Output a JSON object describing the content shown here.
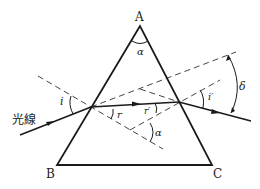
{
  "diagram": {
    "vertices": {
      "A": "A",
      "B": "B",
      "C": "C"
    },
    "labels": {
      "ray": "光線",
      "apex_angle": "α",
      "incidence_angle": "i",
      "refraction_angle": "r",
      "internal_incidence_angle": "r′",
      "exit_angle": "i′",
      "deviation_angle": "δ",
      "normals_angle": "α"
    },
    "colors": {
      "line": "#1a1a1a",
      "dashed": "#444444",
      "background": "#ffffff"
    }
  }
}
